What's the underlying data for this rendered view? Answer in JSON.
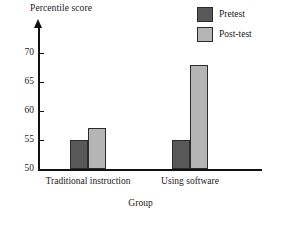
{
  "chart_data": {
    "type": "bar",
    "title": "",
    "ylabel": "Percentile score",
    "xlabel": "Group",
    "categories": [
      "Traditional instruction",
      "Using software"
    ],
    "series": [
      {
        "name": "Pretest",
        "color": "#595959",
        "values": [
          55,
          55
        ]
      },
      {
        "name": "Post-test",
        "color": "#b5b5b5",
        "values": [
          57,
          68
        ]
      }
    ],
    "ylim": [
      50,
      72
    ],
    "yticks": [
      50,
      55,
      60,
      65,
      70
    ],
    "ytick_labels": [
      "50",
      "55",
      "60",
      "65",
      "70"
    ],
    "grid": false,
    "legend_position": "top-right",
    "axis_arrow_y": true
  },
  "legend": {
    "items": [
      {
        "label": "Pretest",
        "color": "#595959"
      },
      {
        "label": "Post-test",
        "color": "#b5b5b5"
      }
    ]
  }
}
